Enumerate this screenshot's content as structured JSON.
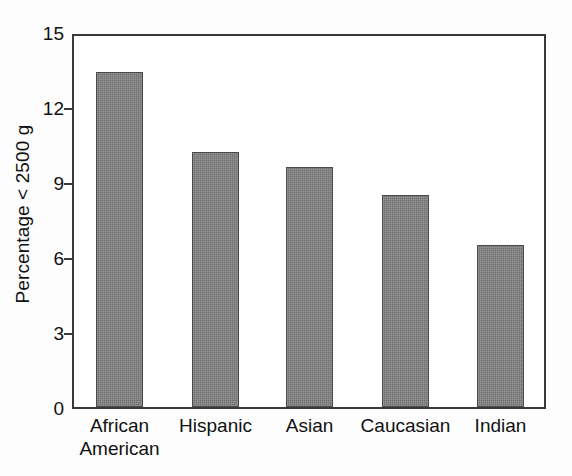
{
  "chart_data": {
    "type": "bar",
    "title": "",
    "xlabel": "",
    "ylabel": "Percentage < 2500 g",
    "categories": [
      "African\nAmerican",
      "Hispanic",
      "Asian",
      "Caucasian",
      "Indian"
    ],
    "values": [
      13.4,
      10.2,
      9.6,
      8.5,
      6.5
    ],
    "ylim": [
      0,
      15
    ],
    "yticks": [
      "0",
      "3",
      "6",
      "9",
      "12",
      "15"
    ],
    "ytick_values": [
      0,
      3,
      6,
      9,
      12,
      15
    ],
    "grid": false,
    "legend": false,
    "bar_color": "#6f6f6f",
    "bar_edge_color": "#4a4a4a",
    "frame_color": "#3a3a3a",
    "background": "#ffffff"
  }
}
